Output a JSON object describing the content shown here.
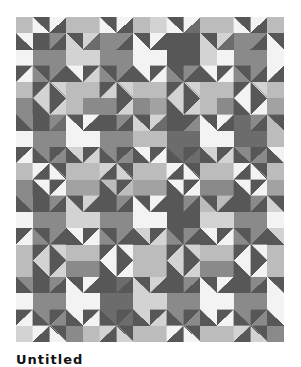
{
  "image": {
    "description": "Grayscale geometric quilt pattern of stars and diamonds made from squares and half-square triangles",
    "caption": "Untitled"
  },
  "quilt": {
    "cols": 16,
    "rows": 20,
    "palette": {
      "A": "#f3f3f3",
      "B": "#d3d3d3",
      "C": "#bcbcbc",
      "D": "#a2a2a2",
      "E": "#8a8a8a",
      "F": "#6c6c6c",
      "G": "#575757"
    },
    "grid": [
      [
        "C",
        "G/A:\\",
        "A/G:/",
        "C",
        "C",
        "G/A:\\",
        "A/G:/",
        "C",
        "B",
        "G/A:\\",
        "A/F:/",
        "C",
        "C",
        "G/A:\\",
        "A/G:/",
        "C"
      ],
      [
        "A/G:\\",
        "G",
        "E/G:/",
        "G/B:\\",
        "B/F:/",
        "E",
        "E/G:/",
        "G/A:\\",
        "A/G:/",
        "G",
        "G",
        "G/B:\\",
        "B/F:/",
        "E",
        "E/G:/",
        "G/A:\\"
      ],
      [
        "A",
        "E",
        "E",
        "B",
        "B",
        "E",
        "E",
        "A",
        "A",
        "G",
        "G",
        "B",
        "A",
        "E",
        "E",
        "A"
      ],
      [
        "G/A:/",
        "G/E:\\",
        "E/G:/",
        "A/G:\\",
        "G/B:/",
        "G/E:\\",
        "E/G:/",
        "A/G:\\",
        "G/A:/",
        "G/E:\\",
        "E/G:/",
        "A/G:\\",
        "G/A:/",
        "G/E:\\",
        "E/G:/",
        "A/G:/"
      ],
      [
        "C",
        "G/B:/",
        "B/G:\\",
        "C",
        "C",
        "G/B:/",
        "B/G:\\",
        "C",
        "C",
        "G/B:/",
        "B/G:\\",
        "C",
        "C",
        "G/A:/",
        "B/G:\\",
        "C"
      ],
      [
        "E",
        "B/G:\\",
        "G/B:/",
        "C",
        "E",
        "E",
        "G/B:/",
        "E",
        "D",
        "B/G:\\",
        "G/B:/",
        "C",
        "E",
        "A/G:\\",
        "G/A:/",
        "D"
      ],
      [
        "E/G:\\",
        "G",
        "E/F:/",
        "G/A:\\",
        "A/G:/",
        "G",
        "E/G:/",
        "G/B:\\",
        "B/F:/",
        "G",
        "G/E:/",
        "G/A:\\",
        "A/G:/",
        "F",
        "E/G:/",
        "G/C:\\"
      ],
      [
        "A",
        "E",
        "E",
        "A",
        "A",
        "E",
        "E",
        "C",
        "C",
        "F",
        "F",
        "A",
        "A",
        "F",
        "F",
        "C"
      ],
      [
        "G/A:/",
        "E/G:\\",
        "G/E:/",
        "B/G:\\",
        "G/B:/",
        "E/G:\\",
        "G/E:/",
        "A/G:\\",
        "G/A:/",
        "F/G:\\",
        "G/F:/",
        "B/G:\\",
        "G/B:/",
        "E/G:\\",
        "G/E:/",
        "A/G:\\"
      ],
      [
        "C",
        "A/G:/",
        "G/A:\\",
        "C",
        "C",
        "B/G:/",
        "G/B:\\",
        "C",
        "C",
        "A/G:/",
        "G/A:\\",
        "C",
        "C",
        "A/G:/",
        "G/A:\\",
        "C"
      ],
      [
        "E",
        "A/G:\\",
        "G/A:/",
        "D",
        "D",
        "C/G:\\",
        "G/C:/",
        "D",
        "D",
        "A/G:\\",
        "G/A:/",
        "E",
        "E",
        "A/G:\\",
        "G/A:/",
        "D"
      ],
      [
        "E/G:\\",
        "G",
        "E/G:/",
        "G/B:\\",
        "B/G:/",
        "G",
        "E/G:/",
        "G/A:\\",
        "A/G:/",
        "G",
        "E/G:/",
        "G/C:\\",
        "C/G:/",
        "G",
        "E/G:/",
        "G/B:\\"
      ],
      [
        "A",
        "E",
        "E",
        "B",
        "B",
        "E",
        "E",
        "A",
        "A",
        "G",
        "G",
        "B",
        "B",
        "E",
        "E",
        "A"
      ],
      [
        "G/A:/",
        "G/E:\\",
        "E/G:/",
        "A/G:\\",
        "G/A:/",
        "G/E:\\",
        "E/G:/",
        "B/G:\\",
        "G/B:/",
        "G/E:\\",
        "E/G:/",
        "A/G:\\",
        "G/A:/",
        "G/E:\\",
        "E/G:/",
        "B/G:\\"
      ],
      [
        "C",
        "G/B:/",
        "B/G:\\",
        "C",
        "C",
        "G/A:/",
        "A/G:\\",
        "C",
        "C",
        "G/B:/",
        "B/G:\\",
        "C",
        "C",
        "G/A:/",
        "A/G:\\",
        "C"
      ],
      [
        "C",
        "B/G:\\",
        "G/B:/",
        "E",
        "E",
        "A/G:\\",
        "G/A:/",
        "C",
        "C",
        "B/G:\\",
        "G/B:/",
        "E",
        "E",
        "A/G:\\",
        "G/A:/",
        "C"
      ],
      [
        "E/G:\\",
        "G",
        "E/G:/",
        "G/A:\\",
        "A/G:/",
        "G",
        "F/G:/",
        "G/B:\\",
        "B/G:/",
        "G",
        "E/G:/",
        "G/A:\\",
        "A/G:/",
        "G",
        "E/G:/",
        "G/A:\\"
      ],
      [
        "A",
        "E",
        "E",
        "A",
        "A",
        "F",
        "F",
        "B",
        "B",
        "E",
        "E",
        "A",
        "A",
        "E",
        "E",
        "A"
      ],
      [
        "G/A:/",
        "E/G:\\",
        "G/E:/",
        "A/G:\\",
        "G/A:/",
        "F/G:\\",
        "G/F:/",
        "B/G:\\",
        "G/B:/",
        "E/G:\\",
        "G/E:/",
        "A/G:\\",
        "G/A:/",
        "E/G:\\",
        "G/E:/",
        "A/G:\\"
      ],
      [
        "B",
        "A/G:/",
        "G/A:\\",
        "E",
        "C",
        "B/G:/",
        "G/B:\\",
        "C",
        "C",
        "A/G:/",
        "G/A:\\",
        "C",
        "C",
        "B/G:/",
        "G/B:\\",
        "E"
      ]
    ]
  }
}
